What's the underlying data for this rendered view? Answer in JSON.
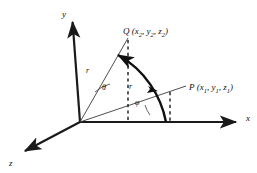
{
  "figure": {
    "type": "spherical-coordinates-diagram",
    "background": "#ffffff",
    "stroke_color": "#1a1a1a",
    "labels": {
      "axis_y": "y",
      "axis_x": "x",
      "axis_z": "z",
      "point_q": "Q (x2, y2, z2)",
      "point_q_name": "Q",
      "point_q_c1": "x",
      "point_q_c1_sub": "2",
      "point_q_c2": "y",
      "point_q_c2_sub": "2",
      "point_q_c3": "z",
      "point_q_c3_sub": "2",
      "point_p": "P (x1, y1, z1)",
      "point_p_name": "P",
      "point_p_c1": "x",
      "point_p_c1_sub": "1",
      "point_p_c2": "y",
      "point_p_c2_sub": "1",
      "point_p_c3": "z",
      "point_p_c3_sub": "1",
      "radius_q": "r",
      "radius_p": "r",
      "angle_theta": "θ",
      "angle_phi": "φ"
    },
    "geometry": {
      "origin": [
        80,
        122
      ],
      "y_axis_tip": [
        72,
        18
      ],
      "x_axis_tip": [
        243,
        122
      ],
      "z_axis_tip": [
        20,
        156
      ],
      "q_point": [
        128,
        38
      ],
      "p_point": [
        170,
        92
      ],
      "arc_radius": 94,
      "theta_arc_radius": 34,
      "phi_arc_radius": 30
    }
  }
}
